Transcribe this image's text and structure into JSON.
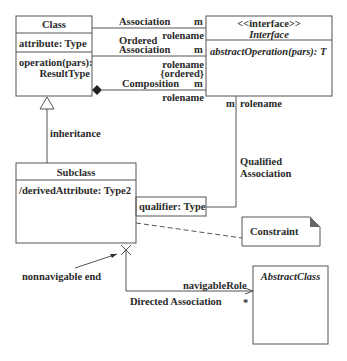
{
  "class_box": {
    "name": "Class",
    "attribute": "attribute: Type",
    "operation_line1": "operation(pars):",
    "operation_line2": "ResultType"
  },
  "interface_box": {
    "stereotype": "<<interface>>",
    "name": "Interface",
    "operation": "abstractOperation(pars): T"
  },
  "associations": {
    "association": {
      "label": "Association",
      "multiplicity": "m",
      "role": "rolename"
    },
    "ordered": {
      "label_line1": "Ordered",
      "label_line2": "Association",
      "multiplicity": "m",
      "role": "rolename",
      "constraint": "{ordered}"
    },
    "composition": {
      "label": "Composition",
      "multiplicity": "m",
      "role": "rolename"
    },
    "qualified": {
      "multiplicity": "m",
      "role": "rolename",
      "label_line1": "Qualified",
      "label_line2": "Association",
      "qualifier": "qualifier: Type"
    },
    "inheritance": {
      "label": "inheritance"
    },
    "directed": {
      "label": "Directed Association",
      "role": "navigableRole",
      "multiplicity": "*",
      "nonnavigable_label": "nonnavigable end"
    }
  },
  "subclass_box": {
    "name": "Subclass",
    "attribute": "/derivedAttribute: Type2"
  },
  "constraint_note": {
    "text": "Constraint"
  },
  "abstract_box": {
    "name": "AbstractClass"
  },
  "colors": {
    "line": "#555555",
    "text": "#2a2a2a",
    "note_fold": "#666666"
  }
}
